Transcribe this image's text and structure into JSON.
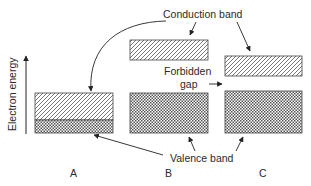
{
  "diagram": {
    "axis": {
      "label": "Electron energy"
    },
    "labels": {
      "conduction_band": "Conduction band",
      "forbidden_gap_line1": "Forbidden",
      "forbidden_gap_line2": "gap",
      "valence_band": "Valence band"
    },
    "panels": [
      {
        "id": "A",
        "label": "A",
        "description": "Overlapping conduction and valence bands (conductor)"
      },
      {
        "id": "B",
        "label": "B",
        "description": "Large forbidden gap between bands (insulator)"
      },
      {
        "id": "C",
        "label": "C",
        "description": "Small forbidden gap between bands (semiconductor)"
      }
    ],
    "colors": {
      "line": "#333333",
      "background": "#ffffff"
    }
  }
}
